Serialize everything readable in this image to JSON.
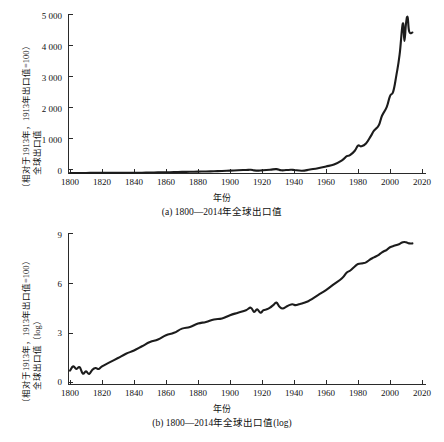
{
  "figure": {
    "background": "#ffffff",
    "line_color": "#1c1c1c",
    "axis_color": "#2a2a2a"
  },
  "panels": {
    "a": {
      "caption": "(a) 1800—2014年全球出口值",
      "xlabel": "年份",
      "ylabel_line1": "全球出口值",
      "ylabel_line2": "（相对于1913年，1913年出口值=100）",
      "yticks": [
        "0",
        "1 000",
        "2 000",
        "3 000",
        "4 000",
        "5 000"
      ],
      "xticks": [
        "1800",
        "1820",
        "1840",
        "1860",
        "1880",
        "1900",
        "1920",
        "1940",
        "1960",
        "1980",
        "2000",
        "2020"
      ]
    },
    "b": {
      "caption": "(b) 1800—2014年全球出口值(log)",
      "xlabel": "年份",
      "ylabel_line1": "全球出口值（log）",
      "ylabel_line2": "（相对于1913年，1913年出口值=100）",
      "yticks": [
        "0",
        "3",
        "6",
        "9"
      ],
      "xticks": [
        "1800",
        "1820",
        "1840",
        "1860",
        "1880",
        "1900",
        "1920",
        "1940",
        "1960",
        "1980",
        "2000",
        "2020"
      ]
    }
  },
  "chart_data": [
    {
      "type": "line",
      "id": "panel-a",
      "title": "(a) 1800—2014年全球出口值",
      "xlabel": "年份",
      "ylabel": "全球出口值（相对于1913年，1913年出口值=100）",
      "xlim": [
        1800,
        2020
      ],
      "ylim": [
        0,
        5000
      ],
      "xticks": [
        1800,
        1820,
        1840,
        1860,
        1880,
        1900,
        1920,
        1940,
        1960,
        1980,
        2000,
        2020
      ],
      "yticks": [
        0,
        1000,
        2000,
        3000,
        4000,
        5000
      ],
      "grid": false,
      "legend": "none",
      "series": [
        {
          "name": "全球出口值",
          "x": [
            1800,
            1805,
            1810,
            1815,
            1820,
            1825,
            1830,
            1835,
            1840,
            1845,
            1850,
            1855,
            1860,
            1865,
            1870,
            1875,
            1880,
            1885,
            1890,
            1895,
            1900,
            1905,
            1910,
            1913,
            1915,
            1918,
            1920,
            1925,
            1929,
            1932,
            1935,
            1938,
            1940,
            1945,
            1950,
            1955,
            1960,
            1965,
            1970,
            1973,
            1975,
            1978,
            1980,
            1982,
            1985,
            1988,
            1990,
            1993,
            1995,
            1998,
            2000,
            2002,
            2004,
            2006,
            2008,
            2009,
            2010,
            2011,
            2012,
            2014
          ],
          "y": [
            2,
            2,
            2,
            3,
            3,
            4,
            5,
            6,
            8,
            10,
            14,
            19,
            24,
            28,
            34,
            38,
            44,
            48,
            56,
            62,
            74,
            86,
            96,
            100,
            82,
            75,
            84,
            104,
            122,
            86,
            92,
            100,
            96,
            70,
            110,
            150,
            205,
            270,
            400,
            530,
            560,
            700,
            860,
            840,
            930,
            1160,
            1330,
            1500,
            1800,
            2080,
            2420,
            2560,
            3080,
            3720,
            4700,
            4150,
            4700,
            4900,
            4450,
            4420
          ]
        }
      ],
      "annotations": []
    },
    {
      "type": "line",
      "id": "panel-b",
      "title": "(b) 1800—2014年全球出口值(log)",
      "xlabel": "年份",
      "ylabel": "全球出口值（log）（相对于1913年，1913年出口值=100）",
      "xlim": [
        1800,
        2020
      ],
      "ylim": [
        0,
        9
      ],
      "xticks": [
        1800,
        1820,
        1840,
        1860,
        1880,
        1900,
        1920,
        1940,
        1960,
        1980,
        2000,
        2020
      ],
      "yticks": [
        0,
        3,
        6,
        9
      ],
      "grid": false,
      "legend": "none",
      "series": [
        {
          "name": "全球出口值 (log)",
          "x": [
            1800,
            1802,
            1804,
            1806,
            1808,
            1810,
            1812,
            1814,
            1816,
            1818,
            1820,
            1825,
            1830,
            1835,
            1840,
            1845,
            1850,
            1855,
            1860,
            1865,
            1870,
            1875,
            1880,
            1885,
            1890,
            1895,
            1900,
            1905,
            1910,
            1913,
            1915,
            1917,
            1919,
            1921,
            1923,
            1925,
            1927,
            1929,
            1931,
            1933,
            1935,
            1937,
            1939,
            1941,
            1943,
            1945,
            1948,
            1950,
            1955,
            1960,
            1965,
            1970,
            1973,
            1975,
            1978,
            1980,
            1983,
            1985,
            1988,
            1990,
            1993,
            1995,
            1998,
            2000,
            2003,
            2006,
            2008,
            2010,
            2012,
            2014
          ],
          "y": [
            0.8,
            1.05,
            0.9,
            1.0,
            0.62,
            0.75,
            0.6,
            0.85,
            0.95,
            0.9,
            1.05,
            1.3,
            1.55,
            1.8,
            2.0,
            2.25,
            2.5,
            2.65,
            2.9,
            3.05,
            3.3,
            3.4,
            3.6,
            3.7,
            3.85,
            3.9,
            4.1,
            4.25,
            4.4,
            4.55,
            4.3,
            4.45,
            4.25,
            4.4,
            4.45,
            4.55,
            4.7,
            4.85,
            4.6,
            4.5,
            4.6,
            4.7,
            4.75,
            4.7,
            4.75,
            4.8,
            4.9,
            5.0,
            5.3,
            5.6,
            5.95,
            6.3,
            6.65,
            6.75,
            7.0,
            7.15,
            7.2,
            7.25,
            7.45,
            7.55,
            7.7,
            7.85,
            8.0,
            8.15,
            8.25,
            8.35,
            8.45,
            8.45,
            8.38,
            8.38
          ]
        }
      ],
      "annotations": []
    }
  ]
}
